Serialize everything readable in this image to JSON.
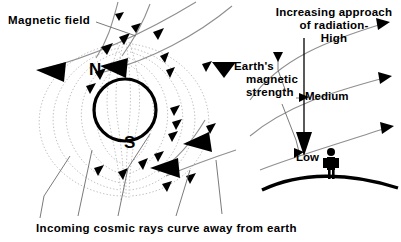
{
  "figure": {
    "kind": "scientific-diagram",
    "background_color": "#ffffff",
    "ink_color": "#000000",
    "fieldline_color": "#b4b4b4",
    "trajectory_color": "#8c8c8c"
  },
  "labels": {
    "magnetic_field": "Magnetic field",
    "radiation": {
      "line1": "Increasing approach",
      "line2": "of radiation-",
      "line3": "High"
    },
    "magnetic_strength": {
      "line1": "Earth's",
      "line2": "magnetic",
      "line3": "strength"
    },
    "medium": "Medium",
    "low": "Low",
    "pole_north": "N",
    "pole_south": "S",
    "caption": "Incoming cosmic rays curve away from earth"
  },
  "elements": {
    "earth_globe": "earth-circle",
    "earth_surface": "ground-arc",
    "person": "human-figure-silhouette",
    "radiation_shaft": "vertical-radiation-arrow",
    "strength_levels": [
      "High",
      "Medium",
      "Low"
    ]
  }
}
